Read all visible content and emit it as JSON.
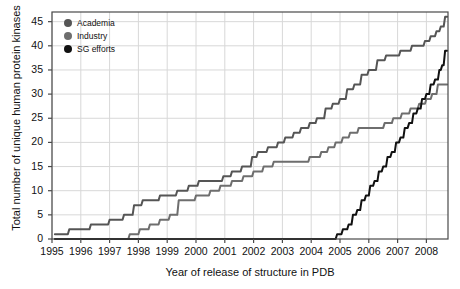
{
  "chart_data": {
    "type": "line",
    "title": "",
    "xlabel": "Year of release of structure in PDB",
    "ylabel": "Total number of unique human protein kinases",
    "xlim": [
      1995,
      2008.75
    ],
    "ylim": [
      0,
      47
    ],
    "xticks": [
      1995,
      1996,
      1997,
      1998,
      1999,
      2000,
      2001,
      2002,
      2003,
      2004,
      2005,
      2006,
      2007,
      2008
    ],
    "yticks": [
      0,
      5,
      10,
      15,
      20,
      25,
      30,
      35,
      40,
      45
    ],
    "grid": true,
    "legend_position": "top-left",
    "colors": {
      "academia": "#555555",
      "industry": "#6e6e6e",
      "sg_efforts": "#111111",
      "grid": "#d8d8d8",
      "axis": "#4a4a4a",
      "background": "#ffffff"
    },
    "series": [
      {
        "name": "Academia",
        "color": "#555555",
        "points": [
          [
            1995.1,
            1
          ],
          [
            1995.55,
            1
          ],
          [
            1995.6,
            2
          ],
          [
            1996.3,
            2
          ],
          [
            1996.35,
            3
          ],
          [
            1996.95,
            3
          ],
          [
            1997.0,
            4
          ],
          [
            1997.45,
            4
          ],
          [
            1997.5,
            5
          ],
          [
            1997.8,
            5
          ],
          [
            1997.85,
            7
          ],
          [
            1998.1,
            7
          ],
          [
            1998.15,
            8
          ],
          [
            1998.7,
            8
          ],
          [
            1998.75,
            9
          ],
          [
            1999.3,
            9
          ],
          [
            1999.35,
            10
          ],
          [
            1999.7,
            10
          ],
          [
            1999.75,
            11
          ],
          [
            2000.05,
            11
          ],
          [
            2000.1,
            12
          ],
          [
            2000.9,
            12
          ],
          [
            2000.95,
            13
          ],
          [
            2001.2,
            13
          ],
          [
            2001.25,
            14
          ],
          [
            2001.55,
            14
          ],
          [
            2001.6,
            15
          ],
          [
            2001.9,
            15
          ],
          [
            2001.95,
            17
          ],
          [
            2002.1,
            17
          ],
          [
            2002.15,
            18
          ],
          [
            2002.45,
            18
          ],
          [
            2002.5,
            19
          ],
          [
            2002.8,
            19
          ],
          [
            2002.85,
            20
          ],
          [
            2003.05,
            20
          ],
          [
            2003.1,
            21
          ],
          [
            2003.35,
            21
          ],
          [
            2003.4,
            22
          ],
          [
            2003.6,
            22
          ],
          [
            2003.65,
            23
          ],
          [
            2003.9,
            23
          ],
          [
            2003.95,
            24
          ],
          [
            2004.15,
            24
          ],
          [
            2004.2,
            25
          ],
          [
            2004.45,
            25
          ],
          [
            2004.5,
            27
          ],
          [
            2004.7,
            27
          ],
          [
            2004.75,
            28
          ],
          [
            2004.95,
            28
          ],
          [
            2005.0,
            29
          ],
          [
            2005.2,
            29
          ],
          [
            2005.25,
            31
          ],
          [
            2005.45,
            31
          ],
          [
            2005.5,
            32
          ],
          [
            2005.7,
            32
          ],
          [
            2005.75,
            34
          ],
          [
            2005.95,
            34
          ],
          [
            2006.0,
            35
          ],
          [
            2006.25,
            35
          ],
          [
            2006.3,
            37
          ],
          [
            2006.55,
            37
          ],
          [
            2006.6,
            38
          ],
          [
            2007.05,
            38
          ],
          [
            2007.1,
            39
          ],
          [
            2007.45,
            39
          ],
          [
            2007.5,
            40
          ],
          [
            2007.9,
            40
          ],
          [
            2007.95,
            41
          ],
          [
            2008.1,
            41
          ],
          [
            2008.15,
            42
          ],
          [
            2008.3,
            42
          ],
          [
            2008.35,
            43
          ],
          [
            2008.45,
            43
          ],
          [
            2008.5,
            44
          ],
          [
            2008.6,
            44
          ],
          [
            2008.65,
            46
          ],
          [
            2008.72,
            46
          ]
        ]
      },
      {
        "name": "Industry",
        "color": "#6e6e6e",
        "points": [
          [
            1997.65,
            0
          ],
          [
            1997.7,
            1
          ],
          [
            1998.0,
            1
          ],
          [
            1998.05,
            2
          ],
          [
            1998.35,
            2
          ],
          [
            1998.4,
            3
          ],
          [
            1998.7,
            3
          ],
          [
            1998.75,
            4
          ],
          [
            1999.05,
            4
          ],
          [
            1999.1,
            5
          ],
          [
            1999.35,
            5
          ],
          [
            1999.4,
            8
          ],
          [
            1999.95,
            8
          ],
          [
            2000.0,
            9
          ],
          [
            2000.45,
            9
          ],
          [
            2000.5,
            10
          ],
          [
            2000.8,
            10
          ],
          [
            2000.85,
            11
          ],
          [
            2001.2,
            11
          ],
          [
            2001.25,
            12
          ],
          [
            2001.6,
            12
          ],
          [
            2001.65,
            13
          ],
          [
            2001.95,
            13
          ],
          [
            2002.0,
            14
          ],
          [
            2002.3,
            14
          ],
          [
            2002.35,
            15
          ],
          [
            2002.65,
            15
          ],
          [
            2002.7,
            16
          ],
          [
            2003.9,
            16
          ],
          [
            2003.95,
            17
          ],
          [
            2004.3,
            17
          ],
          [
            2004.35,
            18
          ],
          [
            2004.55,
            18
          ],
          [
            2004.6,
            19
          ],
          [
            2004.8,
            19
          ],
          [
            2004.85,
            20
          ],
          [
            2005.05,
            20
          ],
          [
            2005.1,
            21
          ],
          [
            2005.3,
            21
          ],
          [
            2005.35,
            22
          ],
          [
            2005.6,
            22
          ],
          [
            2005.65,
            23
          ],
          [
            2006.5,
            23
          ],
          [
            2006.55,
            24
          ],
          [
            2006.8,
            24
          ],
          [
            2006.85,
            25
          ],
          [
            2007.1,
            25
          ],
          [
            2007.15,
            26
          ],
          [
            2007.4,
            26
          ],
          [
            2007.45,
            27
          ],
          [
            2007.7,
            27
          ],
          [
            2007.75,
            28
          ],
          [
            2007.95,
            28
          ],
          [
            2008.0,
            29
          ],
          [
            2008.15,
            29
          ],
          [
            2008.2,
            30
          ],
          [
            2008.35,
            30
          ],
          [
            2008.4,
            32
          ],
          [
            2008.72,
            32
          ]
        ]
      },
      {
        "name": "SG efforts",
        "color": "#111111",
        "points": [
          [
            1995.1,
            0
          ],
          [
            2004.85,
            0
          ],
          [
            2004.9,
            1
          ],
          [
            2005.05,
            1
          ],
          [
            2005.1,
            2
          ],
          [
            2005.25,
            2
          ],
          [
            2005.3,
            3
          ],
          [
            2005.4,
            3
          ],
          [
            2005.45,
            5
          ],
          [
            2005.55,
            5
          ],
          [
            2005.6,
            6
          ],
          [
            2005.7,
            6
          ],
          [
            2005.75,
            8
          ],
          [
            2005.85,
            8
          ],
          [
            2005.9,
            9
          ],
          [
            2006.0,
            9
          ],
          [
            2006.05,
            11
          ],
          [
            2006.15,
            11
          ],
          [
            2006.2,
            12
          ],
          [
            2006.3,
            12
          ],
          [
            2006.35,
            14
          ],
          [
            2006.45,
            14
          ],
          [
            2006.5,
            15
          ],
          [
            2006.6,
            15
          ],
          [
            2006.65,
            17
          ],
          [
            2006.75,
            17
          ],
          [
            2006.8,
            18
          ],
          [
            2006.9,
            18
          ],
          [
            2006.95,
            20
          ],
          [
            2007.05,
            20
          ],
          [
            2007.1,
            21
          ],
          [
            2007.2,
            21
          ],
          [
            2007.25,
            23
          ],
          [
            2007.35,
            23
          ],
          [
            2007.4,
            24
          ],
          [
            2007.5,
            24
          ],
          [
            2007.55,
            26
          ],
          [
            2007.65,
            26
          ],
          [
            2007.7,
            27
          ],
          [
            2007.8,
            27
          ],
          [
            2007.85,
            29
          ],
          [
            2007.95,
            29
          ],
          [
            2008.0,
            30
          ],
          [
            2008.1,
            30
          ],
          [
            2008.15,
            32
          ],
          [
            2008.25,
            32
          ],
          [
            2008.3,
            33
          ],
          [
            2008.4,
            33
          ],
          [
            2008.45,
            35
          ],
          [
            2008.5,
            35
          ],
          [
            2008.55,
            36
          ],
          [
            2008.6,
            36
          ],
          [
            2008.65,
            39
          ],
          [
            2008.72,
            39
          ]
        ]
      }
    ],
    "legend": [
      {
        "label": "Academia",
        "color": "#555555"
      },
      {
        "label": "Industry",
        "color": "#6e6e6e"
      },
      {
        "label": "SG efforts",
        "color": "#111111"
      }
    ]
  }
}
